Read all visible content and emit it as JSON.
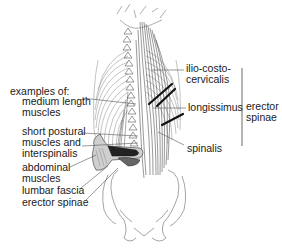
{
  "figure": {
    "colors": {
      "line": "#555555",
      "dark": "#111111",
      "text": "#1a1a1a",
      "background": "#ffffff"
    },
    "left_labels": {
      "heading": "examples of:",
      "items": [
        {
          "id": "medium-length-muscles",
          "line1": "medium length",
          "line2": "muscles"
        },
        {
          "id": "short-postural-muscles",
          "line1": "short postural",
          "line2": "muscles and",
          "line3": "interspinalis"
        },
        {
          "id": "abdominal-muscles",
          "line1": "abdominal",
          "line2": "muscles"
        },
        {
          "id": "lumbar-fascia",
          "line1": "lumbar fascia"
        },
        {
          "id": "erector-spinae-lower",
          "line1": "erector spinae"
        }
      ]
    },
    "right_labels": {
      "items": [
        {
          "id": "ilio-costo-cervicalis",
          "line1": "ilio-costo-",
          "line2": "cervicalis"
        },
        {
          "id": "longissimus",
          "line1": "longissimus"
        },
        {
          "id": "spinalis",
          "line1": "spinalis"
        }
      ],
      "group": {
        "line1": "erector",
        "line2": "spinae"
      }
    }
  }
}
